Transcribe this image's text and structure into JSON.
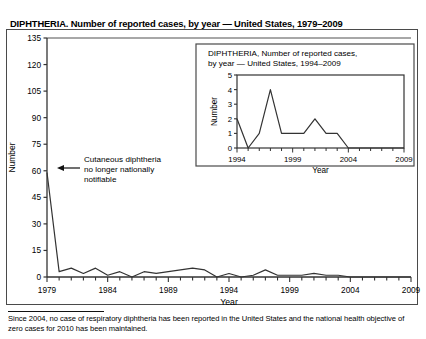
{
  "figure": {
    "title": "DIPHTHERIA. Number of reported cases, by year — United States, 1979–2009",
    "footnote": "Since 2004, no case of respiratory diphtheria has been reported in the United States and the national health objective of zero cases for 2010 has been maintained.",
    "annotation": {
      "line1": "Cutaneous diphtheria",
      "line2": "no longer nationally",
      "line3": "notifiable",
      "arrow_name": "annotation-arrow"
    },
    "colors": {
      "line": "#333333",
      "axis": "#333333",
      "frame": "#4a4a4a",
      "background": "#ffffff"
    }
  },
  "chart_data": [
    {
      "id": "main-chart",
      "type": "line",
      "title": "DIPHTHERIA. Number of reported cases, by year — United States, 1979–2009",
      "xlabel": "Year",
      "ylabel": "Number",
      "xlim": [
        1979,
        2009
      ],
      "ylim": [
        0,
        135
      ],
      "yticks": [
        0,
        15,
        30,
        45,
        60,
        75,
        90,
        105,
        120,
        135
      ],
      "xticks": [
        1979,
        1984,
        1989,
        1994,
        1999,
        2004,
        2009
      ],
      "xtick_labels": [
        "1979",
        "1984",
        "1989",
        "1994",
        "1999",
        "2004",
        "2009"
      ],
      "grid": false,
      "legend": false,
      "x": [
        1979,
        1980,
        1981,
        1982,
        1983,
        1984,
        1985,
        1986,
        1987,
        1988,
        1989,
        1990,
        1991,
        1992,
        1993,
        1994,
        1995,
        1996,
        1997,
        1998,
        1999,
        2000,
        2001,
        2002,
        2003,
        2004,
        2005,
        2006,
        2007,
        2008,
        2009
      ],
      "values": [
        59,
        3,
        5,
        2,
        5,
        1,
        3,
        0,
        3,
        2,
        3,
        4,
        5,
        4,
        0,
        2,
        0,
        1,
        4,
        1,
        1,
        1,
        2,
        1,
        1,
        0,
        0,
        0,
        0,
        0,
        0
      ]
    },
    {
      "id": "inset-chart",
      "type": "line",
      "title_line1": "DIPHTHERIA, Number of reported cases,",
      "title_line2": "by year — United States, 1994–2009",
      "xlabel": "Year",
      "ylabel": "Number",
      "xlim": [
        1994,
        2009
      ],
      "ylim": [
        0,
        5
      ],
      "yticks": [
        0,
        1,
        2,
        3,
        4,
        5
      ],
      "xticks": [
        1994,
        1999,
        2004,
        2009
      ],
      "xtick_labels": [
        "1994",
        "1999",
        "2004",
        "2009"
      ],
      "grid": false,
      "legend": false,
      "x": [
        1994,
        1995,
        1996,
        1997,
        1998,
        1999,
        2000,
        2001,
        2002,
        2003,
        2004,
        2005,
        2006,
        2007,
        2008,
        2009
      ],
      "values": [
        2,
        0,
        1,
        4,
        1,
        1,
        1,
        2,
        1,
        1,
        0,
        0,
        0,
        0,
        0,
        0
      ]
    }
  ]
}
